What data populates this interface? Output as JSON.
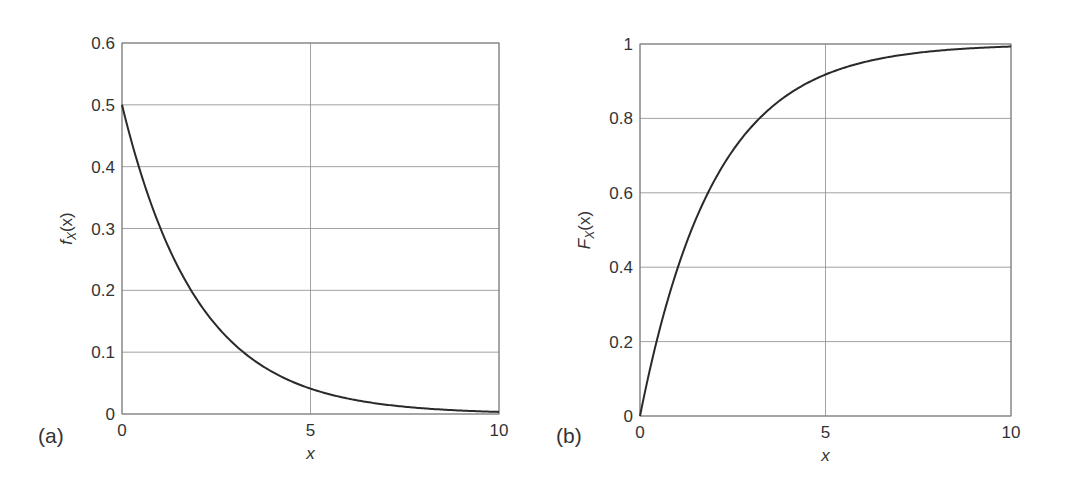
{
  "chart_data": [
    {
      "panel_label": "(a)",
      "type": "line",
      "title": "",
      "xlabel": "x",
      "ylabel": "f_X(x)",
      "ylabel_main": "f",
      "ylabel_sub": "X",
      "ylabel_tail": "(x)",
      "xlim": [
        0,
        10
      ],
      "ylim": [
        0,
        0.6
      ],
      "xticks": [
        0,
        5,
        10
      ],
      "xtick_labels": [
        "0",
        "5",
        "10"
      ],
      "yticks": [
        0,
        0.1,
        0.2,
        0.3,
        0.4,
        0.5,
        0.6
      ],
      "ytick_labels": [
        "0",
        "0.1",
        "0.2",
        "0.3",
        "0.4",
        "0.5",
        "0.6"
      ],
      "grid": true,
      "series": [
        {
          "name": "exponential pdf (lambda = 0.5)",
          "x": [
            0,
            0.5,
            1,
            1.5,
            2,
            2.5,
            3,
            3.5,
            4,
            4.5,
            5,
            5.5,
            6,
            6.5,
            7,
            7.5,
            8,
            8.5,
            9,
            9.5,
            10
          ],
          "y": [
            0.5,
            0.389,
            0.303,
            0.236,
            0.184,
            0.143,
            0.112,
            0.087,
            0.068,
            0.053,
            0.041,
            0.032,
            0.025,
            0.019,
            0.015,
            0.012,
            0.009,
            0.007,
            0.006,
            0.004,
            0.003
          ]
        }
      ]
    },
    {
      "panel_label": "(b)",
      "type": "line",
      "title": "",
      "xlabel": "x",
      "ylabel": "F_X(x)",
      "ylabel_main": "F",
      "ylabel_sub": "X",
      "ylabel_tail": "(x)",
      "xlim": [
        0,
        10
      ],
      "ylim": [
        0,
        1
      ],
      "xticks": [
        0,
        5,
        10
      ],
      "xtick_labels": [
        "0",
        "5",
        "10"
      ],
      "yticks": [
        0,
        0.2,
        0.4,
        0.6,
        0.8,
        1
      ],
      "ytick_labels": [
        "0",
        "0.2",
        "0.4",
        "0.6",
        "0.8",
        "1"
      ],
      "grid": true,
      "series": [
        {
          "name": "exponential cdf (lambda = 0.5)",
          "x": [
            0,
            0.5,
            1,
            1.5,
            2,
            2.5,
            3,
            3.5,
            4,
            4.5,
            5,
            5.5,
            6,
            6.5,
            7,
            7.5,
            8,
            8.5,
            9,
            9.5,
            10
          ],
          "y": [
            0,
            0.221,
            0.393,
            0.528,
            0.632,
            0.713,
            0.777,
            0.826,
            0.865,
            0.895,
            0.918,
            0.936,
            0.95,
            0.961,
            0.97,
            0.976,
            0.982,
            0.986,
            0.989,
            0.991,
            0.993
          ]
        }
      ]
    }
  ],
  "style": {
    "line_color": "#2a2a2a",
    "grid_color": "#8a8a8a",
    "text_color": "#333333"
  }
}
